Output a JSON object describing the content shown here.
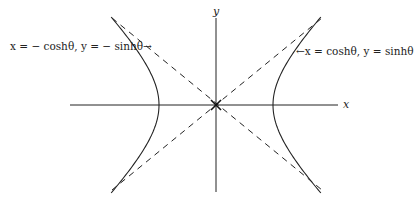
{
  "figure": {
    "origin_px": [
      216,
      105
    ],
    "unit_px": 57,
    "axes": {
      "x_label": "x",
      "y_label": "y"
    },
    "branches": [
      {
        "side": "left",
        "label": "x = − coshθ, y = − sinhθ→",
        "x": "-cosh(theta)",
        "y": "-sinh(theta)"
      },
      {
        "side": "right",
        "label": "←x = coshθ, y = sinhθ",
        "x": "cosh(theta)",
        "y": "sinh(theta)"
      }
    ],
    "asymptotes": [
      "y = x",
      "y = -x"
    ],
    "line_color": "#222222",
    "background": "#ffffff"
  }
}
